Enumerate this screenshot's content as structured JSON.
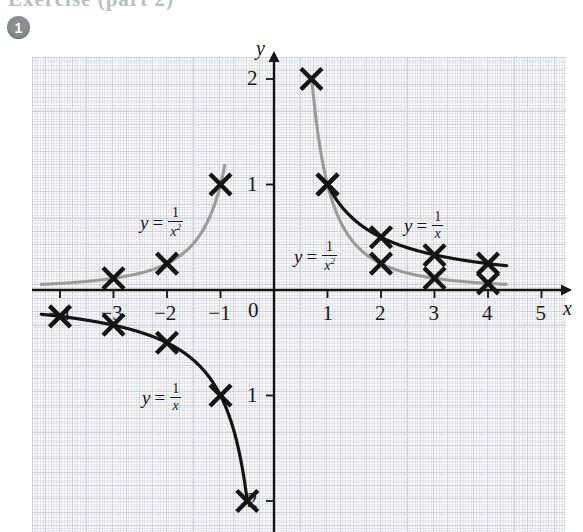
{
  "page": {
    "header_ghost_text": "Exercise  (part 2)",
    "question_number": "1"
  },
  "graph": {
    "x_axis_label": "x",
    "y_axis_label": "y",
    "origin_label": "0",
    "x_ticks": [
      {
        "value": -4,
        "label": "−4"
      },
      {
        "value": -3,
        "label": "−3"
      },
      {
        "value": -2,
        "label": "−2"
      },
      {
        "value": -1,
        "label": "−1"
      },
      {
        "value": 1,
        "label": "1"
      },
      {
        "value": 2,
        "label": "2"
      },
      {
        "value": 3,
        "label": "3"
      },
      {
        "value": 4,
        "label": "4"
      },
      {
        "value": 5,
        "label": "5"
      }
    ],
    "y_ticks": [
      {
        "value": 2,
        "label": "2"
      },
      {
        "value": 1,
        "label": "1"
      },
      {
        "value": -1,
        "label": "1"
      },
      {
        "value": -2,
        "label": "2"
      }
    ],
    "annotations": [
      {
        "id": "a1",
        "var": "y",
        "eq": "=",
        "num": "1",
        "den": "x",
        "den_exp": "2",
        "x_px": 140,
        "y_px": 206
      },
      {
        "id": "a2",
        "var": "y",
        "eq": "=",
        "num": "1",
        "den": "x",
        "den_exp": "2",
        "x_px": 294,
        "y_px": 240
      },
      {
        "id": "a3",
        "var": "y",
        "eq": "=",
        "num": "1",
        "den": "x",
        "den_exp": "",
        "x_px": 404,
        "y_px": 210
      },
      {
        "id": "a4",
        "var": "y",
        "eq": "=",
        "num": "1",
        "den": "x",
        "den_exp": "",
        "x_px": 142,
        "y_px": 382
      }
    ],
    "colors": {
      "curve_reciprocal": "#141414",
      "curve_inverse_square": "#9b9b9b",
      "axis": "#141414",
      "marker": "#141414",
      "grid_fine": "#e2e4e7",
      "grid_bold": "#cfd2d6",
      "badge": "#8a8d91"
    }
  },
  "chart_data": {
    "type": "line",
    "title": "",
    "xlabel": "x",
    "ylabel": "y",
    "xlim": [
      -4.6,
      5.6
    ],
    "ylim": [
      -2.25,
      2.25
    ],
    "grid": true,
    "legend": "inline-annotations",
    "series": [
      {
        "name": "y = 1/x",
        "color": "#141414",
        "marker": "x",
        "points": [
          {
            "x": -4,
            "y": -0.25
          },
          {
            "x": -3,
            "y": -0.33
          },
          {
            "x": -2,
            "y": -0.5
          },
          {
            "x": -1,
            "y": -1
          },
          {
            "x": -0.5,
            "y": -2
          },
          {
            "x": 1,
            "y": 1
          },
          {
            "x": 2,
            "y": 0.5
          },
          {
            "x": 3,
            "y": 0.33
          },
          {
            "x": 4,
            "y": 0.25
          }
        ],
        "plotted_crosses": [
          {
            "x": -4,
            "y": -0.25
          },
          {
            "x": -3,
            "y": -0.33
          },
          {
            "x": -2,
            "y": -0.5
          },
          {
            "x": -1,
            "y": -1
          },
          {
            "x": -0.5,
            "y": -2
          },
          {
            "x": 1,
            "y": 1
          },
          {
            "x": 2,
            "y": 0.5
          },
          {
            "x": 3,
            "y": 0.33
          },
          {
            "x": 4,
            "y": 0.25
          }
        ]
      },
      {
        "name": "y = 1/x^2",
        "color": "#9b9b9b",
        "marker": "x",
        "points": [
          {
            "x": -4,
            "y": 0.0625
          },
          {
            "x": -3,
            "y": 0.111
          },
          {
            "x": -2,
            "y": 0.25
          },
          {
            "x": -1,
            "y": 1
          },
          {
            "x": 0.7,
            "y": 2
          },
          {
            "x": 1,
            "y": 1
          },
          {
            "x": 2,
            "y": 0.25
          },
          {
            "x": 3,
            "y": 0.111
          },
          {
            "x": 4,
            "y": 0.0625
          }
        ],
        "plotted_crosses": [
          {
            "x": -3,
            "y": 0.111
          },
          {
            "x": -2,
            "y": 0.25
          },
          {
            "x": -1,
            "y": 1
          },
          {
            "x": 0.7,
            "y": 2
          },
          {
            "x": 1,
            "y": 1
          },
          {
            "x": 2,
            "y": 0.25
          },
          {
            "x": 3,
            "y": 0.111
          },
          {
            "x": 4,
            "y": 0.0625
          }
        ]
      }
    ]
  }
}
